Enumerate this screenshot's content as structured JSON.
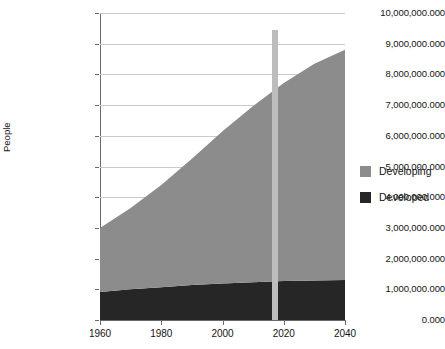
{
  "chart_data": {
    "type": "area",
    "stacked": true,
    "title": "",
    "subtitle": "",
    "xlabel": "",
    "ylabel": "People",
    "xlim": [
      1960,
      2040
    ],
    "ylim": [
      0,
      10000000000
    ],
    "grid": true,
    "legend_position": "right",
    "x": [
      1960,
      1970,
      1980,
      1990,
      2000,
      2010,
      2020,
      2030,
      2040
    ],
    "xtick_labels": [
      "1960",
      "1980",
      "2000",
      "2020",
      "2040"
    ],
    "xtick_values": [
      1960,
      1980,
      2000,
      2020,
      2040
    ],
    "ytick_labels": [
      "0.000",
      "1,000,000.000",
      "2,000,000.000",
      "3,000,000.000",
      "4,000,000.000",
      "5,000,000.000",
      "6,000,000.000",
      "7,000,000.000",
      "8,000,000.000",
      "9,000,000.000",
      "10,000,000.000"
    ],
    "ytick_values": [
      0,
      1000000000,
      2000000000,
      3000000000,
      4000000000,
      5000000000,
      6000000000,
      7000000000,
      8000000000,
      9000000000,
      10000000000
    ],
    "series": [
      {
        "name": "Developed",
        "color": "#262626",
        "values": [
          910000000,
          1000000000,
          1070000000,
          1140000000,
          1190000000,
          1230000000,
          1270000000,
          1290000000,
          1300000000
        ]
      },
      {
        "name": "Developing",
        "color": "#8c8c8c",
        "values": [
          2090000000,
          2650000000,
          3330000000,
          4110000000,
          4960000000,
          5740000000,
          6450000000,
          7060000000,
          7500000000
        ]
      }
    ],
    "totals": [
      3000000000,
      3650000000,
      4400000000,
      5250000000,
      6150000000,
      6970000000,
      7720000000,
      8350000000,
      8800000000
    ],
    "annotations": [
      {
        "name": "current-year-marker",
        "type": "vertical-band",
        "x": 2017,
        "color": "#bdbdbd",
        "label": ""
      }
    ]
  },
  "legend": {
    "items": [
      {
        "label": "Developing",
        "color": "#8c8c8c",
        "swatch": "legend-swatch-developing"
      },
      {
        "label": "Developed",
        "color": "#262626",
        "swatch": "legend-swatch-developed"
      }
    ]
  }
}
